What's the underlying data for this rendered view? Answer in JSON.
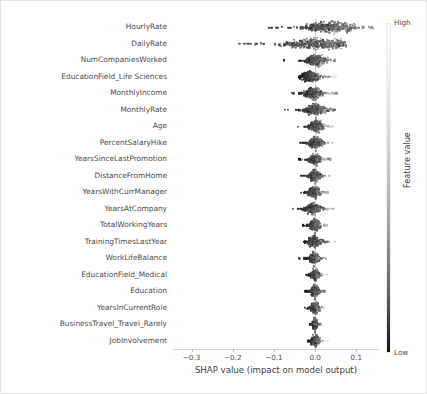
{
  "chart_data": {
    "type": "scatter",
    "subtype": "shap-beeswarm-summary",
    "title": "",
    "xlabel": "SHAP value (impact on model output)",
    "ylabel": "",
    "xlim": [
      -0.345,
      0.155
    ],
    "xticks": [
      -0.3,
      -0.2,
      -0.1,
      0.0,
      0.1
    ],
    "xtick_labels": [
      "−0.3",
      "−0.2",
      "−0.1",
      "0.0",
      "0.1"
    ],
    "grid": false,
    "zero_line": 0.0,
    "colormap": "grayscale",
    "colorbar": {
      "title": "Feature value",
      "high_label": "High",
      "low_label": "Low",
      "high_color": "#ffffff",
      "low_color": "#141414",
      "position": "right"
    },
    "categories": [
      "HourlyRate",
      "DailyRate",
      "NumCompaniesWorked",
      "EducationField_Life Sciences",
      "MonthlyIncome",
      "MonthlyRate",
      "Age",
      "PercentSalaryHike",
      "YearsSinceLastPromotion",
      "DistanceFromHome",
      "YearsWithCurrManager",
      "YearsAtCompany",
      "TotalWorkingYears",
      "TrainingTimesLastYear",
      "WorkLifeBalance",
      "EducationField_Medical",
      "Education",
      "YearsInCurrentRole",
      "BusinessTravel_Travel_Rarely",
      "JobInvolvement"
    ],
    "series": [
      {
        "name": "HourlyRate",
        "x_min": -0.118,
        "x_max": 0.142,
        "x_center": 0.028,
        "spread": 0.052,
        "density_peak": 0.04
      },
      {
        "name": "DailyRate",
        "x_min": -0.33,
        "x_max": 0.075,
        "x_center": -0.01,
        "spread": 0.07,
        "density_peak": 0.012
      },
      {
        "name": "NumCompaniesWorked",
        "x_min": -0.082,
        "x_max": 0.048,
        "x_center": 0.006,
        "spread": 0.02,
        "density_peak": 0.004
      },
      {
        "name": "EducationField_Life Sciences",
        "x_min": -0.04,
        "x_max": 0.052,
        "x_center": 0.002,
        "spread": 0.016,
        "density_peak": -0.012
      },
      {
        "name": "MonthlyIncome",
        "x_min": -0.056,
        "x_max": 0.06,
        "x_center": 0.0,
        "spread": 0.018,
        "density_peak": -0.004
      },
      {
        "name": "MonthlyRate",
        "x_min": -0.092,
        "x_max": 0.048,
        "x_center": 0.0,
        "spread": 0.02,
        "density_peak": 0.002
      },
      {
        "name": "Age",
        "x_min": -0.048,
        "x_max": 0.046,
        "x_center": 0.002,
        "spread": 0.015,
        "density_peak": 0.004
      },
      {
        "name": "PercentSalaryHike",
        "x_min": -0.036,
        "x_max": 0.044,
        "x_center": 0.002,
        "spread": 0.013,
        "density_peak": 0.002
      },
      {
        "name": "YearsSinceLastPromotion",
        "x_min": -0.04,
        "x_max": 0.038,
        "x_center": 0.0,
        "spread": 0.012,
        "density_peak": 0.0
      },
      {
        "name": "DistanceFromHome",
        "x_min": -0.034,
        "x_max": 0.036,
        "x_center": 0.0,
        "spread": 0.011,
        "density_peak": 0.0
      },
      {
        "name": "YearsWithCurrManager",
        "x_min": -0.044,
        "x_max": 0.034,
        "x_center": 0.0,
        "spread": 0.012,
        "density_peak": -0.002
      },
      {
        "name": "YearsAtCompany",
        "x_min": -0.064,
        "x_max": 0.046,
        "x_center": 0.0,
        "spread": 0.016,
        "density_peak": -0.004
      },
      {
        "name": "TotalWorkingYears",
        "x_min": -0.03,
        "x_max": 0.03,
        "x_center": 0.0,
        "spread": 0.01,
        "density_peak": 0.0
      },
      {
        "name": "TrainingTimesLastYear",
        "x_min": -0.028,
        "x_max": 0.062,
        "x_center": 0.004,
        "spread": 0.014,
        "density_peak": -0.002
      },
      {
        "name": "WorkLifeBalance",
        "x_min": -0.04,
        "x_max": 0.026,
        "x_center": -0.002,
        "spread": 0.01,
        "density_peak": -0.002
      },
      {
        "name": "EducationField_Medical",
        "x_min": -0.022,
        "x_max": 0.028,
        "x_center": 0.0,
        "spread": 0.008,
        "density_peak": 0.0
      },
      {
        "name": "Education",
        "x_min": -0.024,
        "x_max": 0.024,
        "x_center": 0.0,
        "spread": 0.008,
        "density_peak": 0.0
      },
      {
        "name": "YearsInCurrentRole",
        "x_min": -0.028,
        "x_max": 0.03,
        "x_center": 0.0,
        "spread": 0.009,
        "density_peak": 0.0
      },
      {
        "name": "BusinessTravel_Travel_Rarely",
        "x_min": -0.014,
        "x_max": 0.014,
        "x_center": 0.0,
        "spread": 0.005,
        "density_peak": 0.0
      },
      {
        "name": "JobInvolvement",
        "x_min": -0.018,
        "x_max": 0.04,
        "x_center": 0.002,
        "spread": 0.008,
        "density_peak": 0.0
      }
    ]
  }
}
